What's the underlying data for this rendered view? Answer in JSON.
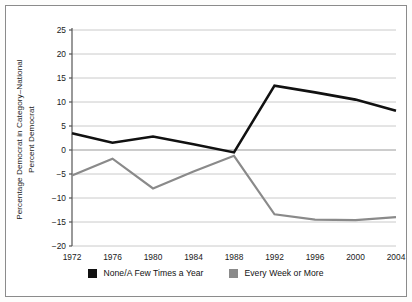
{
  "chart_data": {
    "type": "line",
    "title": "",
    "xlabel": "",
    "ylabel": "Percentage Democrat in Category–National\nPercent Democrat",
    "categories": [
      "1972",
      "1976",
      "1980",
      "1984",
      "1988",
      "1992",
      "1996",
      "2000",
      "2004"
    ],
    "x": [
      1972,
      1976,
      1980,
      1984,
      1988,
      1992,
      1996,
      2000,
      2004
    ],
    "series": [
      {
        "name": "None/A Few Times a Year",
        "color": "#111111",
        "values": [
          3.5,
          1.5,
          2.8,
          1.2,
          -0.5,
          13.4,
          12.0,
          10.5,
          8.2
        ]
      },
      {
        "name": "Every Week or More",
        "color": "#8a8a8a",
        "values": [
          -5.3,
          -1.8,
          -8.0,
          -4.5,
          -1.2,
          -13.4,
          -14.5,
          -14.6,
          -14.0
        ]
      }
    ],
    "ylim": [
      -20,
      25
    ],
    "yticks": [
      25,
      20,
      15,
      10,
      5,
      0,
      -5,
      -10,
      -15,
      -20
    ],
    "ytick_labels": [
      "25",
      "20",
      "15",
      "10",
      "5",
      "0",
      "−5",
      "−10",
      "−15",
      "−20"
    ],
    "grid": true,
    "legend_position": "bottom"
  },
  "legend": {
    "items": [
      {
        "label": "None/A Few Times a Year",
        "color": "#111111"
      },
      {
        "label": "Every Week or More",
        "color": "#8a8a8a"
      }
    ]
  },
  "axes": {
    "y_axis_label": "Percentage Democrat in Category–National\nPercent Democrat"
  }
}
